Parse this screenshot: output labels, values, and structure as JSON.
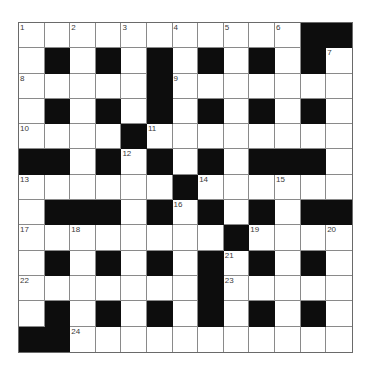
{
  "puzzle": {
    "rows": 13,
    "cols": 13,
    "colors": {
      "black": "#0d0d0d",
      "white": "#ffffff",
      "line": "#8a8a8a"
    },
    "layout": [
      "WWWWWWWWWWWBB",
      "WBWBWBWBWBWBW",
      "WWWWWBWWWWWWW",
      "WBWBWBWBWBWBW",
      "WWWWBWWWWWWWW",
      "BBWBWBWBWBBBW",
      "WWWWWWBWWWWWW",
      "WBBBWBWBWBWBB",
      "WWWWWWWWBWWWW",
      "WBWBWBWBWBWBW",
      "WWWWWWWBWWWWW",
      "WBWBWBWBWBWBW",
      "BBWWWWWWWWWWW"
    ],
    "numbers": [
      {
        "r": 0,
        "c": 0,
        "n": "1"
      },
      {
        "r": 0,
        "c": 2,
        "n": "2"
      },
      {
        "r": 0,
        "c": 4,
        "n": "3"
      },
      {
        "r": 0,
        "c": 6,
        "n": "4"
      },
      {
        "r": 0,
        "c": 8,
        "n": "5"
      },
      {
        "r": 0,
        "c": 10,
        "n": "6"
      },
      {
        "r": 1,
        "c": 12,
        "n": "7"
      },
      {
        "r": 2,
        "c": 0,
        "n": "8"
      },
      {
        "r": 2,
        "c": 6,
        "n": "9"
      },
      {
        "r": 4,
        "c": 0,
        "n": "10"
      },
      {
        "r": 4,
        "c": 5,
        "n": "11"
      },
      {
        "r": 5,
        "c": 4,
        "n": "12"
      },
      {
        "r": 6,
        "c": 0,
        "n": "13"
      },
      {
        "r": 6,
        "c": 7,
        "n": "14"
      },
      {
        "r": 6,
        "c": 10,
        "n": "15"
      },
      {
        "r": 7,
        "c": 6,
        "n": "16"
      },
      {
        "r": 8,
        "c": 0,
        "n": "17"
      },
      {
        "r": 8,
        "c": 2,
        "n": "18"
      },
      {
        "r": 8,
        "c": 9,
        "n": "19"
      },
      {
        "r": 8,
        "c": 12,
        "n": "20"
      },
      {
        "r": 9,
        "c": 8,
        "n": "21"
      },
      {
        "r": 10,
        "c": 0,
        "n": "22"
      },
      {
        "r": 10,
        "c": 8,
        "n": "23"
      },
      {
        "r": 12,
        "c": 2,
        "n": "24"
      }
    ]
  }
}
